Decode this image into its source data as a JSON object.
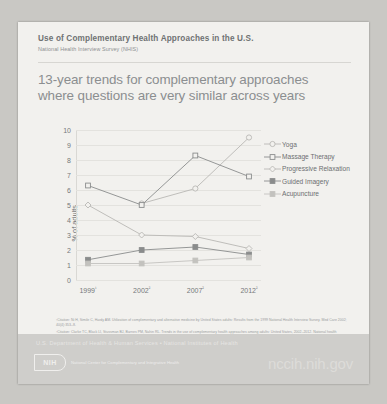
{
  "header": {
    "title": "Use of Complementary Health Approaches in the U.S.",
    "subtitle": "National Health Interview Survey (NHIS)"
  },
  "headline": "13-year trends for complementary approaches where questions are very similar across years",
  "chart_data": {
    "type": "line",
    "title": "13-year trends for complementary approaches where questions are very similar across years",
    "xlabel": "",
    "ylabel": "% of adults",
    "categories": [
      "1999¹",
      "2002²",
      "2007²",
      "2012²"
    ],
    "x_values": [
      1999,
      2002,
      2007,
      2012
    ],
    "ylim": [
      0,
      10
    ],
    "yticks": [
      0,
      1,
      2,
      3,
      4,
      5,
      6,
      7,
      8,
      9,
      10
    ],
    "grid": true,
    "legend_position": "right",
    "series": [
      {
        "name": "Yoga",
        "values": [
          null,
          5.1,
          6.1,
          9.5
        ],
        "color": "#b9b8b4",
        "marker": "circle-open"
      },
      {
        "name": "Massage Therapy",
        "values": [
          6.3,
          5.0,
          8.3,
          6.9
        ],
        "color": "#8a8c8c",
        "marker": "square-open"
      },
      {
        "name": "Progressive Relaxation",
        "values": [
          5.0,
          3.0,
          2.9,
          2.1
        ],
        "color": "#b9b8b4",
        "marker": "diamond-open"
      },
      {
        "name": "Guided Imagery",
        "values": [
          1.35,
          2.0,
          2.2,
          1.7
        ],
        "color": "#8a8c8c",
        "marker": "square-filled"
      },
      {
        "name": "Acupuncture",
        "values": [
          1.1,
          1.1,
          1.3,
          1.5
        ],
        "color": "#c3c2be",
        "marker": "square-filled"
      }
    ]
  },
  "citations": [
    "¹Citation: Ni H, Simile C, Hardy AM. Utilization of complementary and alternative medicine by United States adults: Results from the 1999 National Health Interview Survey. Med Care 2002; 40(4):353–8.",
    "²Citation: Clarke TC, Black LI, Stussman BJ, Barnes PM, Nahin RL. Trends in the use of complementary health approaches among adults: United States, 2002–2012. National health statistics reports; no 79. Hyattsville, MD: National Center for Health Statistics. 2015."
  ],
  "footer": {
    "agency_line": "U.S. Department of Health & Human Services • National Institutes of Health",
    "logo_badge": "NIH",
    "logo_text": "National Center for Complementary and Integrative Health",
    "url": "nccih.nih.gov"
  }
}
